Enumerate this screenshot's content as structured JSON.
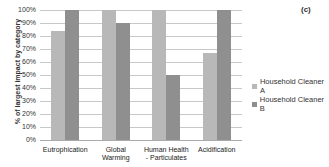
{
  "chart_data": {
    "type": "bar",
    "title": "",
    "panel_label": "(c)",
    "xlabel": "",
    "ylabel": "% of largest impact by category",
    "ylim": [
      0,
      100
    ],
    "yticks": [
      "0%",
      "10%",
      "20%",
      "30%",
      "40%",
      "50%",
      "60%",
      "70%",
      "80%",
      "90%",
      "100%"
    ],
    "grid": true,
    "legend_position": "right",
    "categories": [
      "Eutrophication",
      "Global Warming",
      "Human Health - Particulates",
      "Acidification"
    ],
    "category_labels": [
      [
        "Eutrophication"
      ],
      [
        "Global",
        "Warming"
      ],
      [
        "Human Health",
        "- Particulates"
      ],
      [
        "Acidification"
      ]
    ],
    "series": [
      {
        "name": "Household Cleaner A",
        "color": "#b8b8b8",
        "values": [
          84,
          100,
          100,
          67
        ]
      },
      {
        "name": "Household Cleaner B",
        "color": "#8f8f8f",
        "values": [
          100,
          90,
          50,
          100
        ]
      }
    ]
  }
}
